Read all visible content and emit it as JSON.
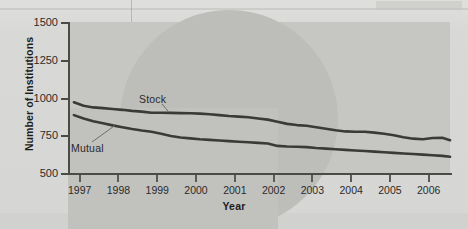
{
  "figure": {
    "background_color": "#d6d6d4",
    "panel_color": "#c6c6c3",
    "line_color": "#3a3a38"
  },
  "chart_data": {
    "type": "line",
    "title": "",
    "xlabel": "Year",
    "ylabel": "Number of Institutions",
    "xlim": [
      1996.75,
      2006.6
    ],
    "ylim": [
      500,
      1500
    ],
    "yticks": [
      500,
      750,
      1000,
      1250,
      1500
    ],
    "xticks": [
      1997,
      1998,
      1999,
      2000,
      2001,
      2002,
      2003,
      2004,
      2005,
      2006
    ],
    "ytick_labels": [
      "500",
      "750",
      "1000",
      "1250",
      "1500"
    ],
    "xtick_labels": [
      "1997",
      "1998",
      "1999",
      "2000",
      "2001",
      "2002",
      "2003",
      "2004",
      "2005",
      "2006"
    ],
    "grid": false,
    "legend": "inline-annotations",
    "annotations": [
      {
        "label": "Stock",
        "points_to_year": 1999.3,
        "points_to_value": 910
      },
      {
        "label": "Mutual",
        "points_to_year": 1997.9,
        "points_to_value": 820
      }
    ],
    "series": [
      {
        "name": "Stock",
        "x": [
          1996.85,
          1997.1,
          1997.35,
          1997.6,
          1997.85,
          1998.1,
          1998.35,
          1998.6,
          1998.85,
          1999.1,
          1999.35,
          1999.6,
          1999.85,
          2000.1,
          2000.35,
          2000.6,
          2000.85,
          2001.1,
          2001.35,
          2001.6,
          2001.85,
          2002.1,
          2002.35,
          2002.6,
          2002.85,
          2003.1,
          2003.35,
          2003.6,
          2003.85,
          2004.1,
          2004.35,
          2004.6,
          2004.85,
          2005.1,
          2005.35,
          2005.6,
          2005.85,
          2006.1,
          2006.35,
          2006.55
        ],
        "values": [
          975,
          952,
          941,
          936,
          930,
          925,
          918,
          913,
          906,
          906,
          905,
          903,
          902,
          900,
          896,
          890,
          884,
          880,
          876,
          868,
          860,
          846,
          832,
          824,
          820,
          810,
          800,
          790,
          782,
          780,
          780,
          774,
          766,
          756,
          744,
          734,
          730,
          738,
          740,
          724
        ],
        "color": "#3a3a38"
      },
      {
        "name": "Mutual",
        "x": [
          1996.85,
          1997.1,
          1997.35,
          1997.6,
          1997.85,
          1998.1,
          1998.35,
          1998.6,
          1998.85,
          1999.1,
          1999.35,
          1999.6,
          1999.85,
          2000.1,
          2000.35,
          2000.6,
          2000.85,
          2001.1,
          2001.35,
          2001.6,
          2001.85,
          2002.1,
          2002.35,
          2002.6,
          2002.85,
          2003.1,
          2003.35,
          2003.6,
          2003.85,
          2004.1,
          2004.35,
          2004.6,
          2004.85,
          2005.1,
          2005.35,
          2005.6,
          2005.85,
          2006.1,
          2006.35,
          2006.55
        ],
        "values": [
          890,
          868,
          850,
          836,
          822,
          810,
          798,
          788,
          780,
          766,
          752,
          742,
          736,
          730,
          726,
          722,
          718,
          714,
          710,
          706,
          702,
          686,
          682,
          680,
          678,
          672,
          668,
          664,
          660,
          656,
          652,
          648,
          644,
          640,
          636,
          632,
          628,
          624,
          620,
          614
        ],
        "color": "#3a3a38"
      }
    ]
  }
}
